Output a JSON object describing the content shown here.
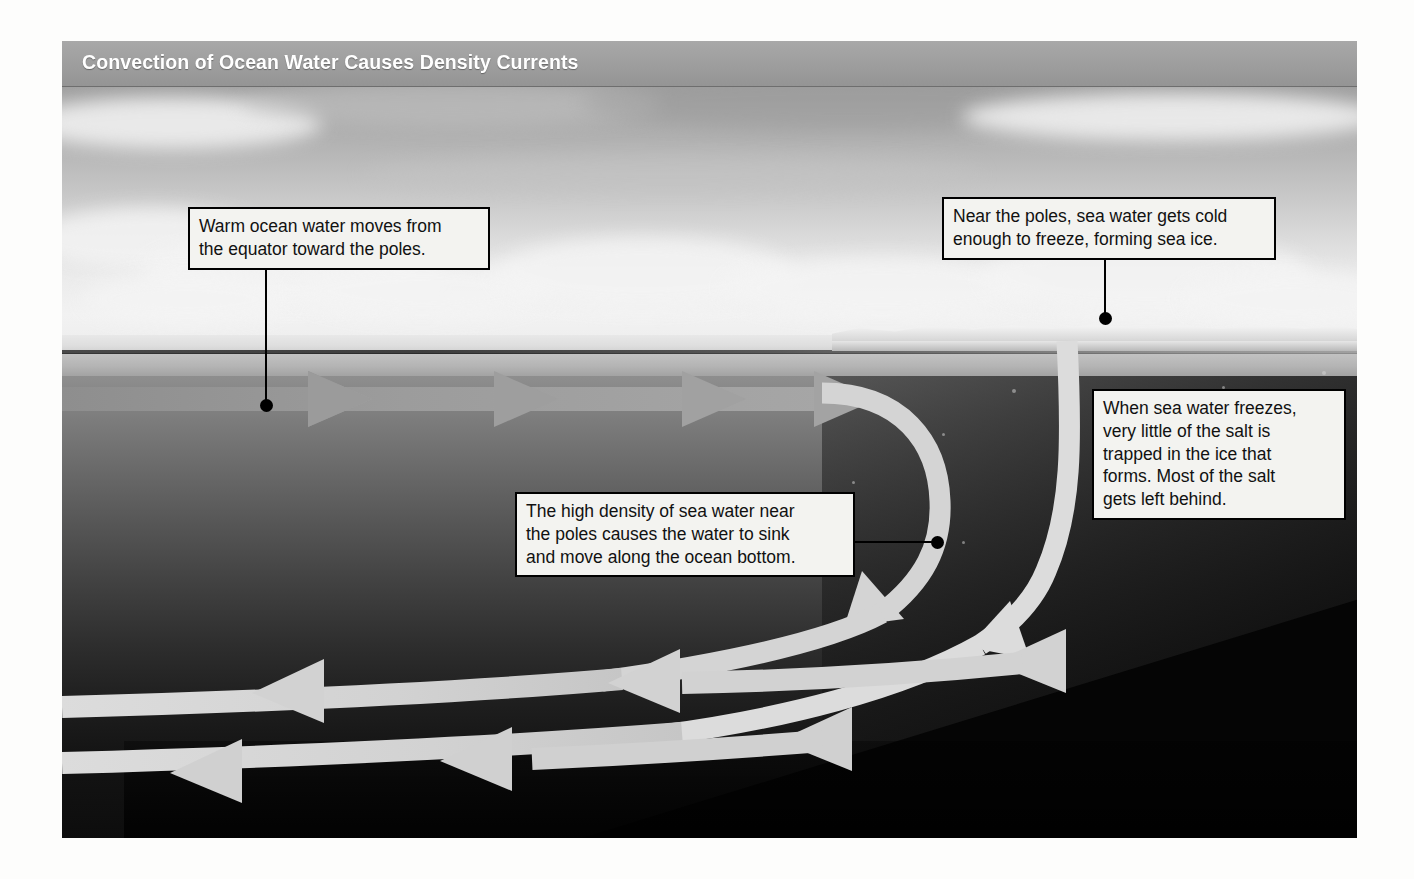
{
  "figure": {
    "title": "Convection of Ocean Water Causes Density Currents",
    "type": "science-diagram"
  },
  "colors": {
    "title_band": "#9d9d9d",
    "title_text": "#ffffff",
    "callout_bg": "#f3f3f0",
    "callout_border": "#000000",
    "surface_arrow": "#9a9a9a",
    "deep_arrow": "#d6d6d6",
    "sea_ice": "#f3f3f3",
    "deep_water": "#0d0d0d"
  },
  "callouts": [
    {
      "id": "warm-surface-flow",
      "text": "Warm ocean water moves from\nthe equator toward the poles.",
      "lines": [
        "Warm ocean water moves from",
        "the equator toward the poles."
      ]
    },
    {
      "id": "sea-ice-formation",
      "text": "Near the poles, sea water gets cold\nenough to freeze, forming sea ice.",
      "lines": [
        "Near the poles, sea water gets cold",
        "enough to freeze, forming sea ice."
      ]
    },
    {
      "id": "salt-left-behind",
      "text": "When sea water freezes,\nvery little of the salt is\ntrapped in the ice that\nforms. Most of the salt\ngets left behind.",
      "lines": [
        "When sea water freezes,",
        "very little of the salt is",
        "trapped in the ice that",
        "forms. Most of the salt",
        "gets left behind."
      ]
    },
    {
      "id": "dense-water-sinks",
      "text": "The high density of sea water near\nthe poles causes the water to sink\nand move along the ocean bottom.",
      "lines": [
        "The high density of sea water near",
        "the poles causes the water to sink",
        "and move along the ocean bottom."
      ]
    }
  ],
  "flows": [
    {
      "id": "surface-current",
      "label": "warm surface current",
      "direction": "left-to-right",
      "depth": "surface"
    },
    {
      "id": "downwelling-inner",
      "label": "sinking water near poles",
      "direction": "downward-curving",
      "depth": "mid"
    },
    {
      "id": "downwelling-outer",
      "label": "cold dense water sinking under sea ice",
      "direction": "downward-curving",
      "depth": "mid"
    },
    {
      "id": "deep-current-upper",
      "label": "deep return current",
      "direction": "right-to-left",
      "depth": "deep"
    },
    {
      "id": "deep-current-lower",
      "label": "bottom return current",
      "direction": "right-to-left",
      "depth": "bottom"
    }
  ],
  "scene": {
    "sky": "overcast sky with cumulus clouds",
    "horizon": "ocean horizon line",
    "sea_ice": "sea ice sheet at right (polar region)",
    "ocean_floor": "dark sloping ocean bottom"
  }
}
